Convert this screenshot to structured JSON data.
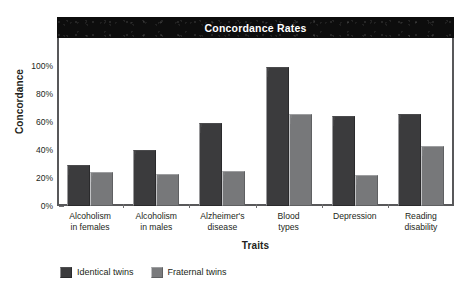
{
  "chart_data": {
    "type": "bar",
    "title": "Concordance Rates",
    "xlabel": "Traits",
    "ylabel": "Concordance",
    "categories": [
      "Alcoholism\nin females",
      "Alcoholism\nin males",
      "Alzheimer's\ndisease",
      "Blood\ntypes",
      "Depression",
      "Reading\ndisability"
    ],
    "category_lines": [
      [
        "Alcoholism",
        "in females"
      ],
      [
        "Alcoholism",
        "in males"
      ],
      [
        "Alzheimer's",
        "disease"
      ],
      [
        "Blood",
        "types"
      ],
      [
        "Depression",
        ""
      ],
      [
        "Reading",
        "disability"
      ]
    ],
    "series": [
      {
        "name": "Identical twins",
        "color": "#3b3b3d",
        "values": [
          29,
          40,
          59,
          99,
          64,
          66
        ]
      },
      {
        "name": "Fraternal twins",
        "color": "#77787a",
        "values": [
          24,
          23,
          25,
          66,
          22,
          43
        ]
      }
    ],
    "ylim": [
      0,
      100
    ],
    "ytick_values": [
      0,
      20,
      40,
      60,
      80,
      100
    ],
    "ytick_labels": [
      "0%",
      "20%",
      "40%",
      "60%",
      "80%",
      "100%"
    ],
    "grid": false,
    "legend_position": "bottom-left",
    "value_suffix": "%"
  },
  "legend": [
    {
      "label": "Identical twins",
      "swatch": "identical"
    },
    {
      "label": "Fraternal twins",
      "swatch": "fraternal"
    }
  ]
}
